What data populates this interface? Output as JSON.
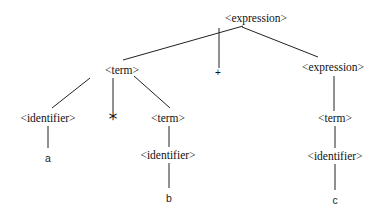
{
  "diagram": {
    "type": "parse-tree",
    "colors": {
      "line": "#222222",
      "text": "#111111",
      "background": "#ffffff"
    },
    "nodes": [
      {
        "id": "n0",
        "label": "<expression>",
        "x": 256,
        "y": 19
      },
      {
        "id": "n1",
        "label": "<term>",
        "x": 122,
        "y": 71
      },
      {
        "id": "n2",
        "label": "+",
        "x": 218,
        "y": 73
      },
      {
        "id": "n3",
        "label": "<expression>",
        "x": 333,
        "y": 68
      },
      {
        "id": "n4",
        "label": "<identifier>",
        "x": 48,
        "y": 119
      },
      {
        "id": "n5",
        "label": "*",
        "x": 113,
        "y": 118
      },
      {
        "id": "n6",
        "label": "<term>",
        "x": 168,
        "y": 119
      },
      {
        "id": "n7",
        "label": "<term>",
        "x": 335,
        "y": 119
      },
      {
        "id": "n8",
        "label": "a",
        "x": 48,
        "y": 158
      },
      {
        "id": "n9",
        "label": "<identifier>",
        "x": 168,
        "y": 156
      },
      {
        "id": "n10",
        "label": "<identifier>",
        "x": 335,
        "y": 157
      },
      {
        "id": "n11",
        "label": "b",
        "x": 169,
        "y": 198
      },
      {
        "id": "n12",
        "label": "c",
        "x": 335,
        "y": 200
      }
    ],
    "edges": [
      {
        "from": "n0",
        "to": "n1",
        "x1": 243,
        "y1": 26,
        "x2": 123,
        "y2": 60
      },
      {
        "from": "n0",
        "to": "n2",
        "x1": 219,
        "y1": 28,
        "x2": 219,
        "y2": 68
      },
      {
        "from": "n0",
        "to": "n3",
        "x1": 242,
        "y1": 27,
        "x2": 318,
        "y2": 57
      },
      {
        "from": "n1",
        "to": "n4",
        "x1": 90,
        "y1": 78,
        "x2": 52,
        "y2": 108
      },
      {
        "from": "n1",
        "to": "n5",
        "x1": 113,
        "y1": 78,
        "x2": 113,
        "y2": 112
      },
      {
        "from": "n1",
        "to": "n6",
        "x1": 134,
        "y1": 76,
        "x2": 170,
        "y2": 108
      },
      {
        "from": "n3",
        "to": "n7",
        "x1": 334,
        "y1": 76,
        "x2": 334,
        "y2": 111
      },
      {
        "from": "n4",
        "to": "n8",
        "x1": 48,
        "y1": 126,
        "x2": 48,
        "y2": 148
      },
      {
        "from": "n6",
        "to": "n9",
        "x1": 169,
        "y1": 126,
        "x2": 169,
        "y2": 147
      },
      {
        "from": "n7",
        "to": "n10",
        "x1": 335,
        "y1": 126,
        "x2": 335,
        "y2": 148
      },
      {
        "from": "n9",
        "to": "n11",
        "x1": 169,
        "y1": 163,
        "x2": 169,
        "y2": 188
      },
      {
        "from": "n10",
        "to": "n12",
        "x1": 335,
        "y1": 164,
        "x2": 335,
        "y2": 190
      }
    ]
  }
}
